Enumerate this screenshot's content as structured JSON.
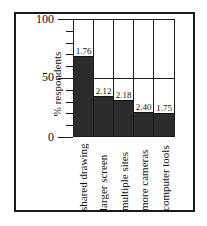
{
  "chart_data": {
    "type": "bar",
    "title": "",
    "xlabel": "",
    "ylabel": "% respondents",
    "ylim": [
      0,
      100
    ],
    "yticks": [
      0,
      50,
      100
    ],
    "ytick_minor_step": 10,
    "grid": "horizontal at 50",
    "legend": null,
    "categories": [
      "shared drawing",
      "larger screen",
      "multiple sites",
      "more cameras",
      "computer tools"
    ],
    "values": [
      68,
      34,
      30,
      20,
      19
    ],
    "bar_annotations": [
      "1.76",
      "2.12",
      "2.18",
      "2.40",
      "1.75"
    ]
  },
  "axis": {
    "y_title": "% respondents",
    "y_labels": {
      "top": "100",
      "mid": "50",
      "bottom": "0"
    }
  },
  "colors": {
    "bar": "#5a5a5a",
    "frame": "#1a1a1a",
    "background": "#ffffff"
  }
}
